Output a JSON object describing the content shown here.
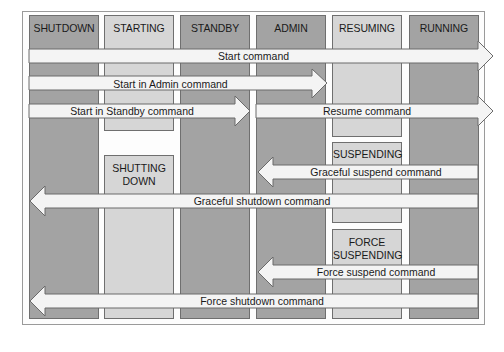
{
  "diagram": {
    "type": "state-transition",
    "columns": [
      {
        "id": "shutdown",
        "label": "SHUTDOWN",
        "shade": "dark"
      },
      {
        "id": "starting",
        "label": "STARTING",
        "shade": "light"
      },
      {
        "id": "standby",
        "label": "STANDBY",
        "shade": "dark"
      },
      {
        "id": "admin",
        "label": "ADMIN",
        "shade": "dark"
      },
      {
        "id": "resuming",
        "label": "RESUMING",
        "shade": "light"
      },
      {
        "id": "running",
        "label": "RUNNING",
        "shade": "dark"
      }
    ],
    "sub_states": {
      "shutting_down": {
        "line1": "SHUTTING",
        "line2": "DOWN",
        "column": "starting"
      },
      "suspending": {
        "line1": "SUSPENDING",
        "column": "resuming"
      },
      "force_suspending": {
        "line1": "FORCE",
        "line2": "SUSPENDING",
        "column": "resuming"
      }
    },
    "transitions": [
      {
        "label": "Start command",
        "from": "shutdown",
        "to": "running",
        "direction": "right"
      },
      {
        "label": "Start in Admin command",
        "from": "shutdown",
        "to": "admin",
        "direction": "right"
      },
      {
        "label": "Start in Standby command",
        "from": "shutdown",
        "to": "standby",
        "direction": "right"
      },
      {
        "label": "Resume command",
        "from": "admin",
        "to": "running",
        "direction": "right"
      },
      {
        "label": "Graceful suspend command",
        "from": "running",
        "to": "admin",
        "direction": "left"
      },
      {
        "label": "Graceful shutdown command",
        "from": "running",
        "to": "shutdown",
        "direction": "left"
      },
      {
        "label": "Force suspend command",
        "from": "running",
        "to": "admin",
        "direction": "left"
      },
      {
        "label": "Force shutdown command",
        "from": "running",
        "to": "shutdown",
        "direction": "left"
      }
    ]
  }
}
